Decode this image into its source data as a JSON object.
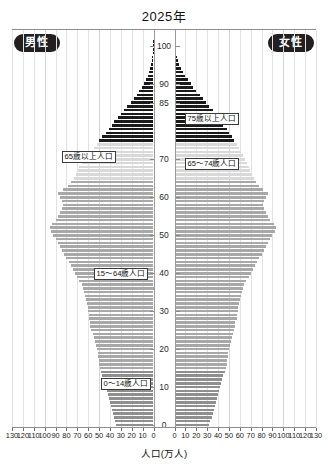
{
  "chart_title": "2025年",
  "badges": {
    "male": "男性",
    "female": "女性"
  },
  "axis": {
    "value_title": "人口(万人)",
    "value_ticks": [
      0,
      10,
      20,
      30,
      40,
      50,
      60,
      70,
      80,
      90,
      100,
      110,
      120,
      130
    ],
    "value_max": 130,
    "age_ticks": [
      0,
      10,
      20,
      30,
      40,
      50,
      60,
      70,
      85,
      90,
      100
    ],
    "age_min": 0,
    "age_max": 102
  },
  "callouts": [
    {
      "id": "over75",
      "text": "75歳以上人口"
    },
    {
      "id": "over65",
      "text": "65歳以上人口"
    },
    {
      "id": "age65_74",
      "text": "65～74歳人口"
    },
    {
      "id": "age15_64",
      "text": "15～64歳人口"
    },
    {
      "id": "age0_14",
      "text": "0～14歳人口"
    }
  ],
  "colors": {
    "over75": "#1a1a1a",
    "age65_74": "#d9d9d9",
    "age15_64": "#a8a8a8",
    "age0_14": "#8f8f8f",
    "axis": "#8d8d8d",
    "grid": "#e2e2e2",
    "badge_bg": "#231f20"
  },
  "chart_data": {
    "type": "bar",
    "subtype": "population-pyramid",
    "title": "2025年",
    "xlabel": "人口(万人)",
    "ylabel": "年齢",
    "xlim": [
      0,
      130
    ],
    "ylim": [
      0,
      102
    ],
    "grid": true,
    "legend_position": "inline-callouts",
    "series": [
      {
        "name": "男性",
        "side": "left"
      },
      {
        "name": "女性",
        "side": "right"
      }
    ],
    "age_groups": [
      {
        "name": "0～14歳人口",
        "range": [
          0,
          14
        ],
        "color": "#8f8f8f"
      },
      {
        "name": "15～64歳人口",
        "range": [
          15,
          64
        ],
        "color": "#a8a8a8"
      },
      {
        "name": "65～74歳人口",
        "range": [
          65,
          74
        ],
        "color": "#d9d9d9"
      },
      {
        "name": "75歳以上人口",
        "range": [
          75,
          102
        ],
        "color": "#1a1a1a"
      }
    ],
    "ages": [
      0,
      1,
      2,
      3,
      4,
      5,
      6,
      7,
      8,
      9,
      10,
      11,
      12,
      13,
      14,
      15,
      16,
      17,
      18,
      19,
      20,
      21,
      22,
      23,
      24,
      25,
      26,
      27,
      28,
      29,
      30,
      31,
      32,
      33,
      34,
      35,
      36,
      37,
      38,
      39,
      40,
      41,
      42,
      43,
      44,
      45,
      46,
      47,
      48,
      49,
      50,
      51,
      52,
      53,
      54,
      55,
      56,
      57,
      58,
      59,
      60,
      61,
      62,
      63,
      64,
      65,
      66,
      67,
      68,
      69,
      70,
      71,
      72,
      73,
      74,
      75,
      76,
      77,
      78,
      79,
      80,
      81,
      82,
      83,
      84,
      85,
      86,
      87,
      88,
      89,
      90,
      91,
      92,
      93,
      94,
      95,
      96,
      97,
      98,
      99,
      100,
      101,
      102
    ],
    "male": [
      34,
      35,
      36,
      37,
      38,
      39,
      40,
      41,
      42,
      43,
      44,
      45,
      46,
      47,
      48,
      49,
      50,
      50,
      51,
      51,
      52,
      53,
      54,
      55,
      56,
      57,
      58,
      58,
      59,
      59,
      60,
      60,
      61,
      62,
      63,
      64,
      65,
      66,
      68,
      70,
      72,
      74,
      76,
      78,
      80,
      82,
      84,
      86,
      88,
      90,
      92,
      94,
      95,
      93,
      90,
      88,
      86,
      84,
      83,
      84,
      86,
      88,
      83,
      79,
      76,
      73,
      71,
      69,
      68,
      66,
      63,
      61,
      58,
      55,
      52,
      50,
      47,
      44,
      41,
      38,
      36,
      33,
      30,
      27,
      24,
      21,
      18,
      15,
      13,
      11,
      9,
      7,
      5,
      4,
      3,
      2,
      1.4,
      1,
      0.6,
      0.35,
      0.2,
      0.1,
      0.05
    ],
    "female": [
      32,
      33,
      34,
      35,
      36,
      37,
      38,
      39,
      40,
      41,
      42,
      43,
      44,
      45,
      46,
      47,
      48,
      48,
      49,
      49,
      50,
      51,
      52,
      53,
      54,
      55,
      56,
      56,
      57,
      57,
      58,
      58,
      59,
      60,
      61,
      62,
      63,
      64,
      66,
      68,
      70,
      72,
      74,
      76,
      78,
      80,
      82,
      84,
      86,
      88,
      90,
      92,
      93,
      91,
      88,
      86,
      84,
      82,
      81,
      82,
      84,
      86,
      81,
      78,
      75,
      73,
      71,
      69,
      68,
      67,
      65,
      63,
      61,
      59,
      57,
      55,
      53,
      50,
      48,
      45,
      43,
      40,
      38,
      35,
      32,
      29,
      26,
      23,
      20,
      17,
      15,
      12,
      10,
      8,
      6,
      4.5,
      3.2,
      2.2,
      1.5,
      0.9,
      0.5,
      0.25,
      0.1
    ]
  }
}
